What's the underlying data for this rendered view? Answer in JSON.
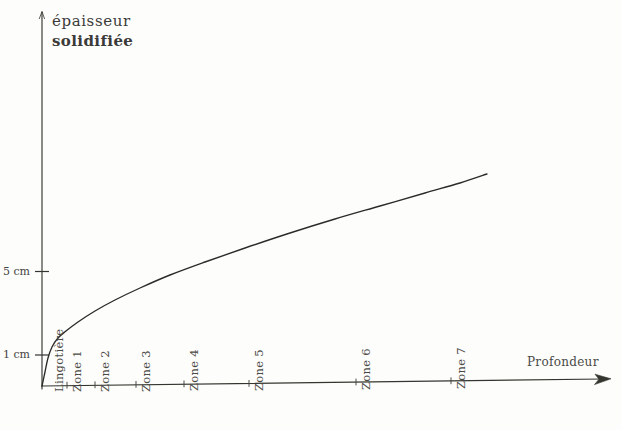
{
  "figure": {
    "background_color": "#fdfdfc",
    "ink_color": "#2b2b28"
  },
  "yaxis": {
    "title_line1": "épaisseur",
    "title_line2": "solidifiée",
    "ticks": [
      {
        "label": "5 cm",
        "value": 5
      },
      {
        "label": "1 cm",
        "value": 1
      }
    ]
  },
  "xaxis": {
    "title": "Profondeur",
    "ticks": [
      {
        "label": "Lingotière",
        "index": 0
      },
      {
        "label": "Zone 1",
        "index": 1
      },
      {
        "label": "Zone 2",
        "index": 2
      },
      {
        "label": "Zone 3",
        "index": 3
      },
      {
        "label": "Zone 4",
        "index": 4
      },
      {
        "label": "Zone 5",
        "index": 5
      },
      {
        "label": "Zone 6",
        "index": 6
      },
      {
        "label": "Zone 7",
        "index": 7
      }
    ]
  },
  "chart_data": {
    "type": "line",
    "title": "épaisseur solidifiée",
    "xlabel": "Profondeur",
    "ylabel": "épaisseur solidifiée",
    "grid": false,
    "legend": null,
    "xtick_labels": [
      "Lingotière",
      "Zone 1",
      "Zone 2",
      "Zone 3",
      "Zone 4",
      "Zone 5",
      "Zone 6",
      "Zone 7"
    ],
    "xtick_pixels": [
      42,
      67,
      95,
      136,
      184,
      249,
      356,
      451
    ],
    "ytick_labels": [
      "1 cm",
      "5 cm"
    ],
    "ytick_values": [
      1,
      5
    ],
    "ytick_pixels": [
      355,
      272
    ],
    "ylim": [
      0,
      12.5
    ],
    "series": [
      {
        "name": "épaisseur solidifiée",
        "x_pixels": [
          42,
          45,
          48,
          52,
          58,
          66,
          78,
          95,
          115,
          140,
          170,
          205,
          245,
          290,
          335,
          380,
          425,
          460,
          487
        ],
        "y_pixels": [
          386,
          372,
          358,
          347,
          338,
          331,
          322,
          311,
          300,
          288,
          275,
          262,
          248,
          233,
          219,
          206,
          193,
          183,
          174
        ],
        "x_values": [
          0.0,
          0.07,
          0.14,
          0.22,
          0.36,
          0.54,
          0.81,
          1.19,
          1.64,
          2.2,
          2.87,
          3.66,
          4.56,
          5.57,
          6.58,
          7.59,
          8.6,
          9.39,
          9.99
        ],
        "y_values": [
          0.0,
          0.84,
          1.69,
          2.35,
          2.89,
          3.31,
          3.86,
          4.52,
          5.18,
          5.9,
          6.69,
          7.47,
          8.31,
          9.22,
          10.06,
          10.84,
          11.63,
          12.23,
          12.77
        ]
      }
    ],
    "annotation": "Solidified shell thickness increases steeply inside the mould then follows a slowly flattening square-root-like growth across the cooling zones."
  }
}
